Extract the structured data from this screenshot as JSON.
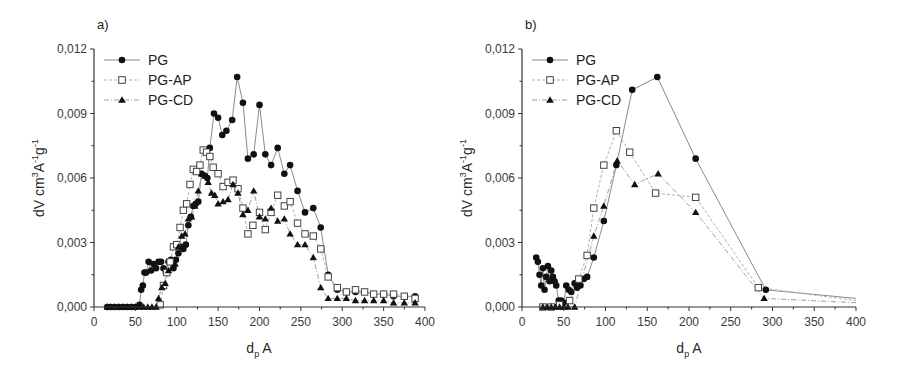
{
  "chart_data": [
    {
      "type": "scatter",
      "panel_label": "a)",
      "title": "",
      "xlabel": "d_p A",
      "xlabel_main": "d",
      "xlabel_sub": "p",
      "xlabel_unit": "A",
      "ylabel": "dV cm^3 A^-1 g^-1",
      "xlim": [
        0,
        400
      ],
      "ylim": [
        0,
        0.012
      ],
      "xticks": [
        0,
        50,
        100,
        150,
        200,
        250,
        300,
        350,
        400
      ],
      "xtick_labels": [
        "0",
        "50",
        "100",
        "150",
        "200",
        "250",
        "300",
        "350",
        "400"
      ],
      "yticks": [
        0,
        0.003,
        0.006,
        0.009,
        0.012
      ],
      "ytick_labels": [
        "0,000",
        "0,003",
        "0,006",
        "0,009",
        "0,012"
      ],
      "grid": false,
      "legend_position": "upper-left",
      "series": [
        {
          "name": "PG",
          "marker": "filled-circle",
          "x": [
            16,
            20,
            25,
            30,
            35,
            40,
            45,
            50,
            55,
            57,
            59,
            61,
            63,
            66,
            69,
            72,
            75,
            78,
            81,
            84,
            87,
            90,
            93,
            96,
            99,
            102,
            105,
            108,
            111,
            114,
            117,
            120,
            123,
            126,
            130,
            134,
            137,
            140,
            145,
            150,
            155,
            160,
            167,
            173,
            180,
            186,
            193,
            200,
            207,
            214,
            222,
            230,
            237,
            246,
            255,
            265,
            274,
            283,
            294,
            305,
            316,
            327,
            338,
            350,
            362,
            375,
            388
          ],
          "y": [
            0,
            0,
            0,
            0,
            0,
            0,
            0,
            0,
            0.0001,
            0.0008,
            0.001,
            0.0016,
            0.0016,
            0.0021,
            0.0017,
            0.002,
            0.0018,
            0.0021,
            0.0021,
            0.0018,
            0.0016,
            0.0021,
            0.0022,
            0.0018,
            0.0022,
            0.0025,
            0.0028,
            0.0027,
            0.0029,
            0.0038,
            0.0042,
            0.0047,
            0.0048,
            0.0049,
            0.0062,
            0.0061,
            0.006,
            0.0074,
            0.009,
            0.0088,
            0.008,
            0.0082,
            0.0087,
            0.0107,
            0.0095,
            0.0069,
            0.0071,
            0.0094,
            0.0071,
            0.0066,
            0.0074,
            0.0062,
            0.0066,
            0.0054,
            0.0044,
            0.0046,
            0.0037,
            0.0015,
            0.0008,
            0.0007,
            0.0007,
            0.0007,
            0.0006,
            0.0006,
            0.0005,
            0.0005,
            0.0005
          ]
        },
        {
          "name": "PG-AP",
          "marker": "open-square",
          "x": [
            80,
            84,
            88,
            92,
            96,
            100,
            104,
            108,
            112,
            116,
            120,
            124,
            128,
            132,
            136,
            140,
            144,
            150,
            156,
            162,
            168,
            174,
            180,
            186,
            192,
            200,
            207,
            214,
            222,
            230,
            237,
            246,
            255,
            265,
            274,
            283,
            294,
            305,
            316,
            327,
            338,
            350,
            362,
            375,
            388
          ],
          "y": [
            0.0001,
            0.001,
            0.0016,
            0.0021,
            0.0028,
            0.0029,
            0.0037,
            0.0045,
            0.0048,
            0.0057,
            0.0064,
            0.0063,
            0.0066,
            0.0073,
            0.0072,
            0.007,
            0.0065,
            0.0062,
            0.0056,
            0.0058,
            0.0059,
            0.0055,
            0.0046,
            0.0034,
            0.0038,
            0.0044,
            0.0036,
            0.0044,
            0.0052,
            0.0047,
            0.0049,
            0.0039,
            0.0034,
            0.0033,
            0.0027,
            0.0014,
            0.0009,
            0.0007,
            0.0008,
            0.0007,
            0.0006,
            0.0006,
            0.0006,
            0.0005,
            0.0004
          ]
        },
        {
          "name": "PG-CD",
          "marker": "filled-triangle",
          "x": [
            16,
            20,
            25,
            30,
            35,
            40,
            45,
            50,
            55,
            60,
            65,
            70,
            75,
            78,
            82,
            86,
            90,
            94,
            98,
            102,
            106,
            110,
            114,
            118,
            122,
            126,
            130,
            134,
            138,
            142,
            146,
            150,
            156,
            162,
            168,
            174,
            180,
            186,
            193,
            200,
            207,
            214,
            222,
            230,
            237,
            246,
            255,
            265,
            274,
            283,
            294,
            305,
            316,
            327,
            338,
            350,
            362,
            375,
            388
          ],
          "y": [
            0,
            0,
            0,
            0,
            0,
            0,
            0,
            0,
            0,
            0,
            0,
            0,
            0,
            0.0004,
            0.0009,
            0.0011,
            0.0017,
            0.0018,
            0.002,
            0.0028,
            0.0033,
            0.0034,
            0.0041,
            0.0042,
            0.0047,
            0.0054,
            0.0062,
            0.0061,
            0.0058,
            0.0053,
            0.0052,
            0.0048,
            0.0049,
            0.005,
            0.0057,
            0.0053,
            0.0043,
            0.0045,
            0.0054,
            0.0042,
            0.0041,
            0.0046,
            0.004,
            0.0041,
            0.0034,
            0.0029,
            0.0029,
            0.0023,
            0.0009,
            0.0004,
            0.0004,
            0.0004,
            0.0003,
            0.0003,
            0.0003,
            0.0003,
            0.0002,
            0.0002,
            0.0002
          ]
        }
      ]
    },
    {
      "type": "line",
      "panel_label": "b)",
      "title": "",
      "xlabel": "d_p A",
      "xlabel_main": "d",
      "xlabel_sub": "p",
      "xlabel_unit": "A",
      "ylabel": "dV cm^3 A^-1 g^-1",
      "xlim": [
        0,
        400
      ],
      "ylim": [
        0,
        0.012
      ],
      "xticks": [
        0,
        50,
        100,
        150,
        200,
        250,
        300,
        350,
        400
      ],
      "xtick_labels": [
        "0",
        "50",
        "100",
        "150",
        "200",
        "250",
        "300",
        "350",
        "400"
      ],
      "yticks": [
        0,
        0.003,
        0.006,
        0.009,
        0.012
      ],
      "ytick_labels": [
        "0,000",
        "0,003",
        "0,006",
        "0,009",
        "0,012"
      ],
      "grid": false,
      "legend_position": "upper-left",
      "series": [
        {
          "name": "PG",
          "marker": "filled-circle",
          "x": [
            17,
            19,
            21,
            23,
            25,
            27,
            29,
            31,
            33,
            35,
            37,
            39,
            41,
            44,
            47,
            50,
            53,
            56,
            59,
            63,
            66,
            70,
            74,
            78,
            86,
            98,
            113,
            132,
            162,
            208,
            292,
            400
          ],
          "y": [
            0.0023,
            0.0021,
            0.0015,
            0.001,
            0.0018,
            0.0008,
            0.0014,
            0.0019,
            0.0012,
            0.0017,
            0.0014,
            0.0012,
            0.001,
            0.0003,
            0.0003,
            0.0002,
            0.001,
            0.0008,
            0.0007,
            0.0011,
            0.0009,
            0.001,
            0.0013,
            0.0014,
            0.0023,
            0.004,
            0.0066,
            0.0101,
            0.0107,
            0.0069,
            0.0008,
            0.0004
          ]
        },
        {
          "name": "PG-AP",
          "marker": "open-square",
          "x": [
            25,
            35,
            45,
            57,
            68,
            78,
            86,
            98,
            113,
            129,
            160,
            208,
            283,
            400
          ],
          "y": [
            0,
            0,
            0.0001,
            0.0003,
            0.0013,
            0.0024,
            0.0046,
            0.0066,
            0.0082,
            0.0072,
            0.0053,
            0.0051,
            0.0009,
            0.0003
          ]
        },
        {
          "name": "PG-CD",
          "marker": "filled-triangle",
          "x": [
            25,
            30,
            35,
            40,
            45,
            50,
            55,
            63,
            86,
            98,
            114,
            135,
            163,
            208,
            290,
            400
          ],
          "y": [
            0,
            0,
            0,
            0,
            0,
            0,
            0,
            0,
            0.0033,
            0.0047,
            0.0068,
            0.0057,
            0.0062,
            0.0044,
            0.0004,
            0.0002
          ]
        }
      ]
    }
  ],
  "panels": [
    {
      "label": "a)",
      "ylabel_main": "dV cm",
      "ylabel_sup1": "3",
      "ylabel_mid": "A",
      "ylabel_sup2": "-1",
      "ylabel_g": "g",
      "ylabel_sup3": "-1",
      "xlabel_main": "d",
      "xlabel_sub": "p",
      "xlabel_unit": " A",
      "legend": [
        "PG",
        "PG-AP",
        "PG-CD"
      ]
    },
    {
      "label": "b)",
      "ylabel_main": "dV cm",
      "ylabel_sup1": "3",
      "ylabel_mid": "A",
      "ylabel_sup2": "-1",
      "ylabel_g": "g",
      "ylabel_sup3": "-1",
      "xlabel_main": "d",
      "xlabel_sub": "p",
      "xlabel_unit": " A",
      "legend": [
        "PG",
        "PG-AP",
        "PG-CD"
      ]
    }
  ],
  "colors": {
    "axis": "#333333",
    "marker": "#111111",
    "line_pg": "#8a8a8a",
    "line_ap": "#b0b0b0",
    "line_cd": "#a0a0a0"
  }
}
